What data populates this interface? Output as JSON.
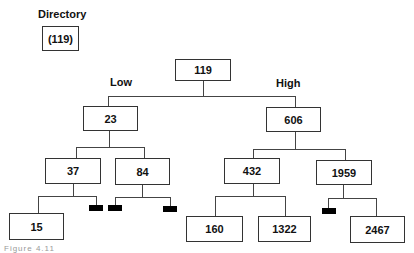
{
  "legend": {
    "title": "Directory",
    "value": "(119)"
  },
  "branch_labels": {
    "low": "Low",
    "high": "High"
  },
  "tree": {
    "root": "119",
    "left": {
      "value": "23",
      "left": {
        "value": "37",
        "left": "15",
        "right": "empty-bucket"
      },
      "right": {
        "value": "84",
        "left": "empty-bucket",
        "right": "empty-bucket"
      }
    },
    "right": {
      "value": "606",
      "left": {
        "value": "432",
        "left": "160",
        "right": "1322"
      },
      "right": {
        "value": "1959",
        "left": "empty-bucket",
        "right": "2467"
      }
    }
  },
  "nodes": {
    "root": "119",
    "n23": "23",
    "n606": "606",
    "n37": "37",
    "n84": "84",
    "n432": "432",
    "n1959": "1959",
    "n15": "15",
    "n160": "160",
    "n1322": "1322",
    "n2467": "2467"
  },
  "caption": "Figure 4.11"
}
